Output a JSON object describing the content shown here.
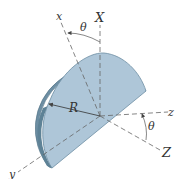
{
  "figure": {
    "colors": {
      "face": "#aec6d8",
      "rim": "#6d8ea3",
      "rim_dark": "#4f7083",
      "axis": "#666666",
      "text": "#333333"
    },
    "labels": {
      "x_axis": "x",
      "X_axis": "X",
      "y_axis": "y",
      "z_axis": "z",
      "Z_axis": "Z",
      "radius": "R",
      "theta_top": "θ",
      "theta_right": "θ"
    }
  }
}
